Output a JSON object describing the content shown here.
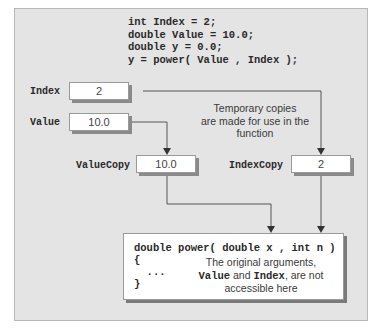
{
  "code_lines": [
    "int Index = 2;",
    "double Value = 10.0;",
    "double y = 0.0;",
    "y = power( Value , Index );"
  ],
  "variables": {
    "index": {
      "label": "Index",
      "value": "2"
    },
    "value": {
      "label": "Value",
      "value": "10.0"
    },
    "value_copy": {
      "label": "ValueCopy",
      "value": "10.0"
    },
    "index_copy": {
      "label": "IndexCopy",
      "value": "2"
    }
  },
  "note_copies": [
    "Temporary copies",
    "are made for use in the",
    "function"
  ],
  "function_box": {
    "signature": "double power( double x , int n )",
    "open_brace": "{",
    "ellipsis": "  ...",
    "close_brace": "}",
    "note_line1": "The original arguments,",
    "note_value": "Value",
    "note_and": " and ",
    "note_index": "Index",
    "note_line2_rest": ", are not",
    "note_line3": "accessible here"
  },
  "colors": {
    "panel_bg": "#e4e4e4",
    "box_bg": "#ffffff",
    "line": "#555555"
  }
}
